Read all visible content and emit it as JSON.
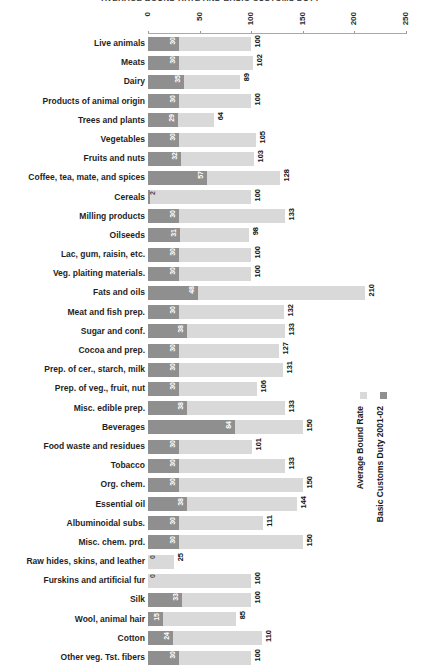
{
  "chart_data": {
    "type": "bar",
    "orientation": "horizontal",
    "title": "AVERAGE BOUND RATE AND BASIC CUSTOMS DUTY",
    "title_left": "120",
    "xlabel": "",
    "ylabel": "",
    "xlim": [
      0,
      250
    ],
    "xticks": [
      0,
      50,
      100,
      150,
      200,
      250
    ],
    "grid": false,
    "legend_position": "right",
    "categories": [
      "Live animals",
      "Meats",
      "Dairy",
      "Products of animal origin",
      "Trees and plants",
      "Vegetables",
      "Fruits and nuts",
      "Coffee, tea, mate, and spices",
      "Cereals",
      "Milling products",
      "Oilseeds",
      "Lac, gum, raisin, etc.",
      "Veg. plaiting materials.",
      "Fats and oils",
      "Meat and fish prep.",
      "Sugar and conf.",
      "Cocoa and prep.",
      "Prep. of cer., starch, milk",
      "Prep. of veg., fruit, nut",
      "Misc. edible prep.",
      "Beverages",
      "Food waste and residues",
      "Tobacco",
      "Org. chem.",
      "Essential oil",
      "Albuminoidal subs.",
      "Misc. chem. prd.",
      "Raw hides, skins, and leather",
      "Furskins and artificial fur",
      "Silk",
      "Wool, animal hair",
      "Cotton",
      "Other veg. Tst. fibers"
    ],
    "series": [
      {
        "name": "Average Bound Rate",
        "color": "#d9d9d9",
        "values": [
          100,
          102,
          89,
          100,
          64,
          105,
          103,
          128,
          100,
          133,
          98,
          100,
          100,
          210,
          132,
          133,
          127,
          131,
          106,
          133,
          150,
          101,
          133,
          150,
          144,
          111,
          150,
          25,
          100,
          100,
          85,
          110,
          100
        ]
      },
      {
        "name": "Basic Customs Duty 2001-02",
        "color": "#8f8f8f",
        "values": [
          30,
          30,
          35,
          30,
          29,
          30,
          32,
          57,
          2,
          30,
          31,
          30,
          30,
          48,
          30,
          38,
          30,
          30,
          30,
          38,
          84,
          30,
          30,
          30,
          38,
          30,
          30,
          0,
          0,
          33,
          15,
          24,
          30
        ]
      }
    ]
  },
  "legend": {
    "entries": [
      {
        "label": "Average Bound Rate",
        "color": "#d9d9d9"
      },
      {
        "label": "Basic Customs Duty 2001-02",
        "color": "#8f8f8f"
      }
    ]
  }
}
